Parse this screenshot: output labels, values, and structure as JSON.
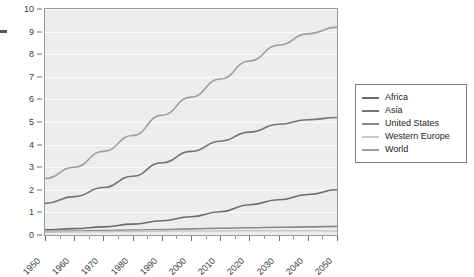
{
  "chart_data": {
    "type": "line",
    "title": "",
    "subtitle": "",
    "xlabel": "",
    "ylabel": "",
    "xlim": [
      1950,
      2050
    ],
    "ylim": [
      0,
      10
    ],
    "grid": true,
    "legend_position": "right",
    "x": [
      1950,
      1960,
      1970,
      1980,
      1990,
      2000,
      2010,
      2020,
      2030,
      2040,
      2050
    ],
    "x_tick_labels": [
      "1950",
      "1960",
      "1970",
      "1980",
      "1990",
      "2000",
      "2010",
      "2020",
      "2030",
      "2040",
      "2050"
    ],
    "y_tick_labels": [
      "0",
      "1",
      "2",
      "3",
      "4",
      "5",
      "6",
      "7",
      "8",
      "9",
      "10"
    ],
    "y_ticks": [
      0,
      1,
      2,
      3,
      4,
      5,
      6,
      7,
      8,
      9,
      10
    ],
    "series": [
      {
        "name": "Africa",
        "color": "#6b6b6b",
        "values": [
          0.23,
          0.28,
          0.36,
          0.48,
          0.63,
          0.81,
          1.03,
          1.34,
          1.56,
          1.79,
          2.0
        ]
      },
      {
        "name": "Asia",
        "color": "#747474",
        "values": [
          1.4,
          1.7,
          2.1,
          2.6,
          3.2,
          3.7,
          4.15,
          4.55,
          4.9,
          5.1,
          5.2
        ]
      },
      {
        "name": "United States",
        "color": "#8a8a8a",
        "values": [
          0.15,
          0.17,
          0.2,
          0.22,
          0.24,
          0.27,
          0.3,
          0.32,
          0.34,
          0.36,
          0.38
        ]
      },
      {
        "name": "Western Europe",
        "color": "#c9c9c9",
        "values": [
          0.13,
          0.14,
          0.15,
          0.16,
          0.17,
          0.18,
          0.18,
          0.19,
          0.19,
          0.19,
          0.18
        ]
      },
      {
        "name": "World",
        "color": "#9e9e9e",
        "values": [
          2.5,
          3.0,
          3.7,
          4.4,
          5.3,
          6.1,
          6.9,
          7.7,
          8.4,
          8.9,
          9.2
        ]
      }
    ]
  },
  "legend": {
    "entries": [
      {
        "label": "Africa",
        "color": "#6b6b6b"
      },
      {
        "label": "Asia",
        "color": "#747474"
      },
      {
        "label": "United States",
        "color": "#8a8a8a"
      },
      {
        "label": "Western Europe",
        "color": "#c9c9c9"
      },
      {
        "label": "World",
        "color": "#9e9e9e"
      }
    ]
  },
  "colors": {
    "plot_background": "#eceded",
    "grid_line": "#fbfbfb",
    "axis": "#9a9a9a",
    "tick_text": "#3b3b3b",
    "legend_border": "#7d7d7d"
  }
}
